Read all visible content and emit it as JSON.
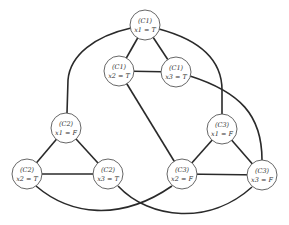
{
  "diagram": {
    "title": "",
    "node_radius": 15,
    "nodes": [
      {
        "id": "c1_x1",
        "clause": "(C1)",
        "literal": "x1 = T",
        "cx": 145,
        "cy": 25
      },
      {
        "id": "c1_x2",
        "clause": "(C1)",
        "literal": "x2 = T",
        "cx": 119,
        "cy": 71
      },
      {
        "id": "c1_x3",
        "clause": "(C1)",
        "literal": "x3 = T",
        "cx": 176,
        "cy": 72
      },
      {
        "id": "c2_x1",
        "clause": "(C2)",
        "literal": "x1 = F",
        "cx": 66,
        "cy": 128
      },
      {
        "id": "c2_x2",
        "clause": "(C2)",
        "literal": "x2 = T",
        "cx": 27,
        "cy": 174
      },
      {
        "id": "c2_x3",
        "clause": "(C2)",
        "literal": "x3 = T",
        "cx": 108,
        "cy": 174
      },
      {
        "id": "c3_x1",
        "clause": "(C3)",
        "literal": "x1 = F",
        "cx": 222,
        "cy": 129
      },
      {
        "id": "c3_x2",
        "clause": "(C3)",
        "literal": "x2 = F",
        "cx": 182,
        "cy": 174
      },
      {
        "id": "c3_x3",
        "clause": "(C3)",
        "literal": "x3 = F",
        "cx": 262,
        "cy": 175
      }
    ],
    "edges": [
      {
        "from": "c1_x1",
        "to": "c1_x2",
        "type": "straight"
      },
      {
        "from": "c1_x1",
        "to": "c1_x3",
        "type": "straight"
      },
      {
        "from": "c1_x2",
        "to": "c1_x3",
        "type": "straight"
      },
      {
        "from": "c2_x1",
        "to": "c2_x2",
        "type": "straight"
      },
      {
        "from": "c2_x1",
        "to": "c2_x3",
        "type": "straight"
      },
      {
        "from": "c2_x2",
        "to": "c2_x3",
        "type": "straight"
      },
      {
        "from": "c3_x1",
        "to": "c3_x2",
        "type": "straight"
      },
      {
        "from": "c3_x1",
        "to": "c3_x3",
        "type": "straight"
      },
      {
        "from": "c3_x2",
        "to": "c3_x3",
        "type": "straight"
      },
      {
        "from": "c1_x1",
        "to": "c2_x1",
        "type": "curve"
      },
      {
        "from": "c1_x1",
        "to": "c3_x1",
        "type": "curve"
      },
      {
        "from": "c1_x2",
        "to": "c3_x2",
        "type": "straight"
      },
      {
        "from": "c1_x3",
        "to": "c3_x3",
        "type": "curve"
      },
      {
        "from": "c2_x2",
        "to": "c3_x2",
        "type": "curve"
      },
      {
        "from": "c2_x3",
        "to": "c3_x3",
        "type": "curve"
      }
    ]
  }
}
